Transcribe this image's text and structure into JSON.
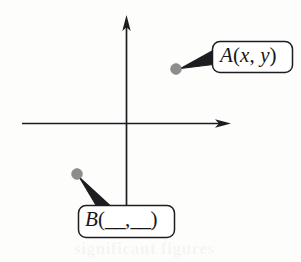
{
  "figure": {
    "kind": "coordinate-plane-diagram",
    "background_color": "#fdfdfc",
    "ink_color": "#17171a",
    "point_color": "#8b8b8b",
    "axes": {
      "y_axis": {
        "name": "y-axis",
        "orientation": "vertical",
        "x": 126,
        "top_y": 16,
        "bottom_y": 205,
        "arrowhead": "up",
        "tick_labels": [],
        "label": ""
      },
      "x_axis": {
        "name": "x-axis",
        "orientation": "horizontal",
        "y": 123,
        "left_x": 22,
        "right_x": 230,
        "arrowhead": "right",
        "tick_labels": [],
        "label": ""
      },
      "origin": [
        126,
        123
      ]
    },
    "points": [
      {
        "id": "A",
        "name": "point-a",
        "cx": 176,
        "cy": 69,
        "r": 5,
        "quadrant": "I",
        "label": "A(x, y)",
        "label_parts": {
          "letter": "A",
          "open_paren": "(",
          "first_coord": "x",
          "comma": ", ",
          "second_coord": "y",
          "close_paren": ")"
        },
        "callout_box": {
          "x": 212,
          "y": 41,
          "width": 81,
          "height": 32,
          "radius": 7
        },
        "pointer_direction": "left"
      },
      {
        "id": "B",
        "name": "point-b",
        "cx": 77,
        "cy": 174,
        "r": 5,
        "quadrant": "III",
        "label": "B(__,__)",
        "label_parts": {
          "letter": "B",
          "open_paren": "(",
          "first_coord": "__",
          "comma": ",",
          "second_coord": "__",
          "close_paren": ")"
        },
        "callout_box": {
          "x": 78,
          "y": 205,
          "width": 97,
          "height": 33,
          "radius": 7
        },
        "pointer_direction": "up-left"
      }
    ],
    "bleed_through": {
      "note": "faint ghosting of text printed on the reverse of the scanned page",
      "line_1": "significant figures",
      "line_2": "",
      "line_3": ""
    }
  }
}
